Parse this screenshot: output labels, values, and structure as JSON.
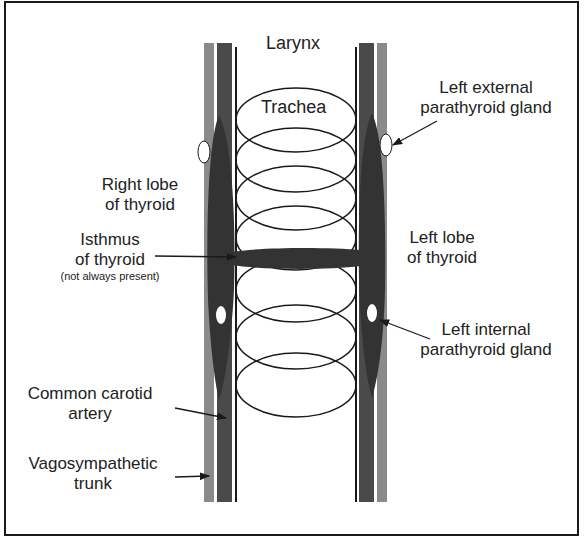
{
  "diagram": {
    "type": "anatomical",
    "colors": {
      "background": "#ffffff",
      "frame": "#1a1a1a",
      "carotid_artery": "#4a4a4a",
      "vagosympathetic_trunk": "#8a8a8a",
      "thyroid": "#333333",
      "parathyroid": "#ffffff",
      "trachea_lines": "#1a1a1a"
    },
    "labels": {
      "larynx": "Larynx",
      "trachea": "Trachea",
      "left_external_parathyroid_line1": "Left external",
      "left_external_parathyroid_line2": "parathyroid gland",
      "right_lobe_line1": "Right lobe",
      "right_lobe_line2": "of thyroid",
      "isthmus_line1": "Isthmus",
      "isthmus_line2": "of thyroid",
      "isthmus_note": "(not always present)",
      "left_lobe_line1": "Left lobe",
      "left_lobe_line2": "of thyroid",
      "left_internal_parathyroid_line1": "Left internal",
      "left_internal_parathyroid_line2": "parathyroid gland",
      "common_carotid_line1": "Common carotid",
      "common_carotid_line2": "artery",
      "vagosympathetic_line1": "Vagosympathetic",
      "vagosympathetic_line2": "trunk"
    },
    "trachea_ring_count": 7
  }
}
